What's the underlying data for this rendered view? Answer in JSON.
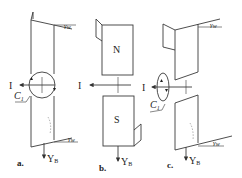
{
  "figure": {
    "panels": [
      {
        "id": "a",
        "caption": "a.",
        "current_label": "I",
        "loop_label": "C",
        "loop_sub": "1",
        "force_label": "Y",
        "force_sub": "B",
        "angle_top": "γ",
        "angle_top_sub": "w",
        "angle_bottom": "γ",
        "angle_bottom_sub": "w"
      },
      {
        "id": "b",
        "caption": "b.",
        "current_label": "I",
        "pole_top": "N",
        "pole_bottom": "S",
        "force_label": "Y",
        "force_sub": "B"
      },
      {
        "id": "c",
        "caption": "c.",
        "current_label": "I",
        "loop_label": "C",
        "loop_sub": "1",
        "force_label": "Y",
        "force_sub": "B",
        "angle_top": "γ",
        "angle_top_sub": "w",
        "angle_bottom": "γ",
        "angle_bottom_sub": "w"
      }
    ],
    "colors": {
      "line": "#3a3a3a",
      "background": "#ffffff"
    }
  }
}
